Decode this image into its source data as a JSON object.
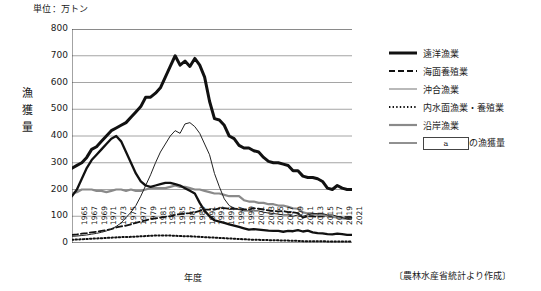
{
  "unit_label": "単位：万トン",
  "y_axis_title": "漁獲量",
  "x_axis_title": "年度",
  "source_note": "〔農林水産省統計より作成〕",
  "legend": {
    "items": [
      {
        "label": "遠洋漁業",
        "style": "thick-solid-black",
        "color": "#111111"
      },
      {
        "label": "海面養殖業",
        "style": "dashed-black",
        "color": "#111111"
      },
      {
        "label": "沖合漁業",
        "style": "thick-solid-gray",
        "color": "#8a8a8a"
      },
      {
        "label": "内水面漁業・養殖業",
        "style": "dotted-black",
        "color": "#111111"
      },
      {
        "label": "沿岸漁業",
        "style": "solid-gray",
        "color": "#7d7d7d"
      },
      {
        "label": "の漁獲量",
        "style": "thin-solid-black",
        "color": "#333333",
        "box_text": "a"
      }
    ]
  },
  "chart_data": {
    "type": "line",
    "title": "",
    "xlabel": "年度",
    "ylabel": "漁獲量",
    "unit": "万トン",
    "ylim": [
      0,
      800
    ],
    "ytick_values": [
      0,
      100,
      200,
      300,
      400,
      500,
      600,
      700,
      800
    ],
    "grid": true,
    "legend_position": "right",
    "x_start": 1964,
    "x_end": 2021,
    "xtick_labels": [
      "1965",
      "1967",
      "1969",
      "1971",
      "1973",
      "1975",
      "1977",
      "1979",
      "1981",
      "1983",
      "1985",
      "1987",
      "1989",
      "1991",
      "1993",
      "1995",
      "1997",
      "1999",
      "2001",
      "2003",
      "2005",
      "2007",
      "2009",
      "2011",
      "2013",
      "2015",
      "2017",
      "2019",
      "2021"
    ],
    "x": [
      1964,
      1965,
      1966,
      1967,
      1968,
      1969,
      1970,
      1971,
      1972,
      1973,
      1974,
      1975,
      1976,
      1977,
      1978,
      1979,
      1980,
      1981,
      1982,
      1983,
      1984,
      1985,
      1986,
      1987,
      1988,
      1989,
      1990,
      1991,
      1992,
      1993,
      1994,
      1995,
      1996,
      1997,
      1998,
      1999,
      2000,
      2001,
      2002,
      2003,
      2004,
      2005,
      2006,
      2007,
      2008,
      2009,
      2010,
      2011,
      2012,
      2013,
      2014,
      2015,
      2016,
      2017,
      2018,
      2019,
      2020,
      2021
    ],
    "series": [
      {
        "name": "a の漁獲量",
        "note": "総漁獲量（合計）",
        "style": "thick-solid-black",
        "values": [
          280,
          290,
          300,
          320,
          350,
          360,
          380,
          400,
          420,
          430,
          440,
          450,
          470,
          490,
          510,
          545,
          545,
          560,
          580,
          620,
          660,
          700,
          665,
          680,
          660,
          690,
          665,
          620,
          530,
          465,
          460,
          440,
          400,
          390,
          365,
          355,
          355,
          345,
          340,
          320,
          305,
          300,
          300,
          295,
          290,
          270,
          270,
          250,
          245,
          245,
          240,
          230,
          205,
          200,
          215,
          205,
          200,
          200
        ]
      },
      {
        "name": "遠洋漁業",
        "style": "thick-solid-black-2",
        "values": [
          175,
          200,
          240,
          280,
          310,
          330,
          350,
          370,
          390,
          400,
          380,
          340,
          300,
          260,
          230,
          215,
          210,
          215,
          220,
          225,
          225,
          220,
          215,
          205,
          195,
          185,
          150,
          120,
          100,
          85,
          80,
          75,
          70,
          65,
          60,
          55,
          50,
          52,
          50,
          48,
          46,
          45,
          45,
          42,
          45,
          44,
          48,
          43,
          46,
          40,
          37,
          36,
          33,
          32,
          35,
          33,
          30,
          30
        ]
      },
      {
        "name": "沖合漁業",
        "style": "thin-solid-black",
        "values": [
          25,
          26,
          28,
          30,
          33,
          36,
          40,
          45,
          52,
          62,
          75,
          95,
          115,
          140,
          175,
          215,
          255,
          300,
          340,
          370,
          400,
          420,
          410,
          445,
          450,
          435,
          410,
          370,
          330,
          260,
          210,
          165,
          140,
          130,
          125,
          120,
          120,
          120,
          120,
          115,
          112,
          110,
          108,
          105,
          105,
          100,
          105,
          100,
          105,
          110,
          110,
          110,
          105,
          105,
          100,
          95,
          90,
          95
        ]
      },
      {
        "name": "沿岸漁業",
        "style": "solid-gray",
        "values": [
          185,
          190,
          200,
          200,
          200,
          195,
          195,
          190,
          195,
          200,
          200,
          195,
          200,
          195,
          195,
          200,
          205,
          205,
          205,
          205,
          210,
          215,
          210,
          210,
          205,
          200,
          200,
          195,
          190,
          185,
          185,
          180,
          175,
          175,
          175,
          160,
          155,
          155,
          150,
          150,
          145,
          145,
          140,
          140,
          135,
          130,
          128,
          115,
          110,
          110,
          105,
          105,
          100,
          98,
          95,
          92,
          90,
          90
        ]
      },
      {
        "name": "海面養殖業",
        "style": "dashed-black",
        "values": [
          30,
          32,
          35,
          37,
          40,
          42,
          45,
          48,
          52,
          58,
          62,
          65,
          70,
          75,
          80,
          85,
          90,
          92,
          95,
          98,
          100,
          105,
          108,
          110,
          112,
          115,
          120,
          125,
          125,
          125,
          130,
          130,
          128,
          128,
          127,
          126,
          125,
          130,
          128,
          125,
          122,
          120,
          118,
          120,
          115,
          115,
          112,
          95,
          100,
          100,
          98,
          100,
          100,
          98,
          98,
          95,
          97,
          95
        ]
      },
      {
        "name": "内水面漁業・養殖業",
        "style": "dotted-black",
        "values": [
          12,
          13,
          14,
          15,
          16,
          17,
          18,
          19,
          20,
          21,
          22,
          22,
          23,
          24,
          25,
          26,
          27,
          28,
          28,
          28,
          28,
          27,
          26,
          25,
          25,
          24,
          23,
          22,
          21,
          20,
          19,
          18,
          17,
          16,
          15,
          14,
          13,
          12,
          12,
          11,
          11,
          10,
          10,
          9,
          9,
          8,
          8,
          7,
          7,
          7,
          7,
          7,
          6,
          6,
          6,
          6,
          6,
          5
        ]
      }
    ]
  }
}
